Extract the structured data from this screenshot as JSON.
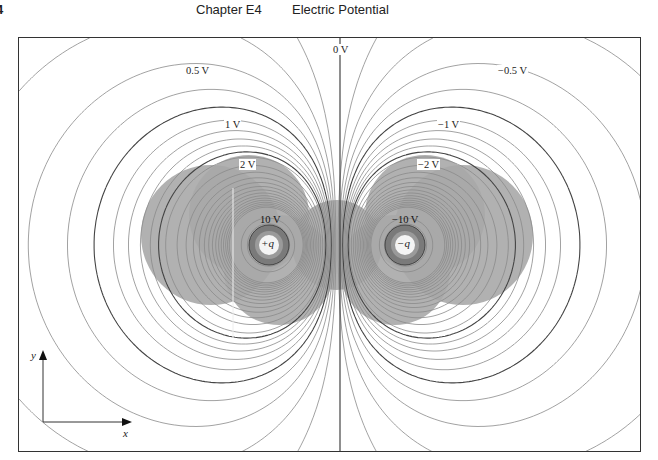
{
  "header": {
    "page_number": "4",
    "chapter": "Chapter E4",
    "title": "Electric Potential"
  },
  "figure": {
    "charges": [
      {
        "label": "+q",
        "sign": 1,
        "cx": 250,
        "cy": 207
      },
      {
        "label": "−q",
        "sign": -1,
        "cx": 386,
        "cy": 207
      }
    ],
    "zero_line_x": 321,
    "potential_labels": [
      {
        "text": "0 V",
        "x": 313,
        "y": 6
      },
      {
        "text": "0.5 V",
        "x": 166,
        "y": 27
      },
      {
        "text": "−0.5 V",
        "x": 478,
        "y": 27
      },
      {
        "text": "1 V",
        "x": 205,
        "y": 81
      },
      {
        "text": "−1 V",
        "x": 418,
        "y": 81
      },
      {
        "text": "2 V",
        "x": 220,
        "y": 121
      },
      {
        "text": "−2 V",
        "x": 398,
        "y": 121
      },
      {
        "text": "10 V",
        "x": 240,
        "y": 176
      },
      {
        "text": "−10 V",
        "x": 372,
        "y": 176
      }
    ],
    "axes": {
      "x_label": "x",
      "y_label": "y"
    },
    "colors": {
      "contour": "#8a8a8a",
      "contour_dark": "#444444",
      "shade": "#a8a8a8",
      "frame": "#333333"
    }
  }
}
